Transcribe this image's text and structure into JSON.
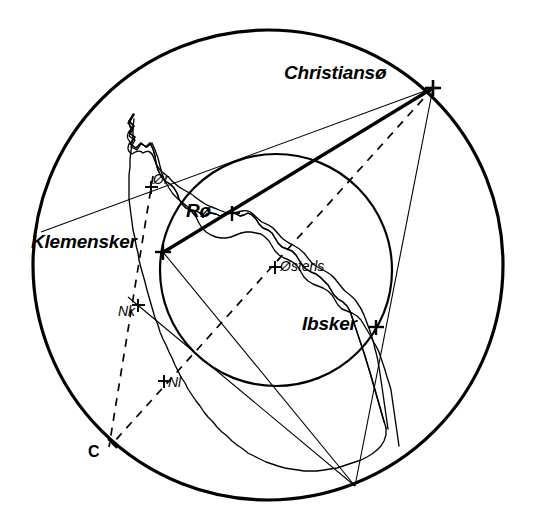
{
  "figure": {
    "background_color": "#ffffff",
    "ink_color": "#000000"
  },
  "labels": {
    "christianso": "Christiansø",
    "klemensker": "Klemensker",
    "ro": "Rø",
    "osterls": "Østerls",
    "ibsker": "Ibsker",
    "or": "Ør",
    "nk": "Nk",
    "nl": "Nl",
    "c": "C"
  },
  "markers": [
    {
      "name": "christianso",
      "label": "Christiansø",
      "x": 433,
      "y": 88,
      "style": "cross-bold",
      "emphasis": "major"
    },
    {
      "name": "klemensker",
      "label": "Klemensker",
      "x": 163,
      "y": 252,
      "style": "cross-bold",
      "emphasis": "major"
    },
    {
      "name": "ro",
      "label": "Rø",
      "x": 232,
      "y": 213,
      "style": "cross-bold",
      "emphasis": "major"
    },
    {
      "name": "osterls",
      "label": "Østerls",
      "x": 275,
      "y": 267,
      "style": "cross",
      "emphasis": "minor"
    },
    {
      "name": "ibsker",
      "label": "Ibsker",
      "x": 376,
      "y": 327,
      "style": "cross-bold",
      "emphasis": "major"
    },
    {
      "name": "or",
      "label": "Ør",
      "x": 151,
      "y": 186,
      "style": "cross",
      "emphasis": "minor"
    },
    {
      "name": "nk",
      "label": "Nk",
      "x": 138,
      "y": 305,
      "style": "cross",
      "emphasis": "minor"
    },
    {
      "name": "nl",
      "label": "Nl",
      "x": 164,
      "y": 381,
      "style": "cross",
      "emphasis": "minor"
    },
    {
      "name": "c",
      "label": "C",
      "x": 112,
      "y": 444,
      "style": "tick",
      "emphasis": "vertex"
    }
  ],
  "circles": [
    {
      "name": "outer-circle",
      "cx": 268,
      "cy": 265,
      "r": 235,
      "stroke_width": 3.2,
      "dash": "none"
    },
    {
      "name": "inner-circle",
      "cx": 276,
      "cy": 270,
      "r": 116,
      "stroke_width": 2.2,
      "dash": "none"
    }
  ],
  "lines": [
    {
      "name": "chord-klemensker-christianso",
      "x1": 163,
      "y1": 252,
      "x2": 433,
      "y2": 88,
      "stroke_width": 3.2,
      "dash": "none"
    },
    {
      "name": "ray-christianso-or",
      "x1": 433,
      "y1": 88,
      "x2": 41,
      "y2": 232,
      "stroke_width": 1.1,
      "dash": "none"
    },
    {
      "name": "ray-christianso-bottom",
      "x1": 433,
      "y1": 88,
      "x2": 355,
      "y2": 486,
      "stroke_width": 1.1,
      "dash": "none"
    },
    {
      "name": "ray-christianso-ibsker-bottom",
      "x1": 433,
      "y1": 88,
      "x2": 356,
      "y2": 486,
      "stroke_width": 1.1,
      "dash": "none"
    },
    {
      "name": "ray-bottom-klemensker",
      "x1": 355,
      "y1": 486,
      "x2": 163,
      "y2": 252,
      "stroke_width": 1.1,
      "dash": "none"
    },
    {
      "name": "ray-bottom-nk",
      "x1": 355,
      "y1": 486,
      "x2": 130,
      "y2": 299,
      "stroke_width": 1.1,
      "dash": "none"
    },
    {
      "name": "dashed-christianso-c",
      "x1": 433,
      "y1": 88,
      "x2": 112,
      "y2": 444,
      "stroke_width": 1.6,
      "dash": "7 6"
    },
    {
      "name": "dashed-or-c",
      "x1": 152,
      "y1": 180,
      "x2": 108,
      "y2": 447,
      "stroke_width": 1.6,
      "dash": "7 6"
    }
  ],
  "geometry_notes": {
    "outer_circle_span_x": [
      33,
      504
    ],
    "outer_circle_span_y": [
      30,
      500
    ],
    "inner_circle_span_x": [
      160,
      392
    ],
    "inner_circle_span_y": [
      154,
      386
    ]
  }
}
